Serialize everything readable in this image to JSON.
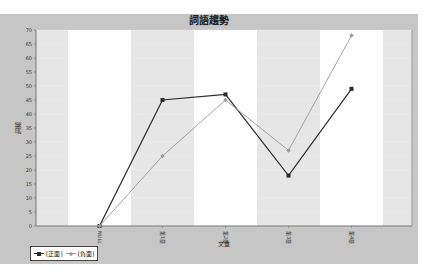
{
  "chart": {
    "title": "詞語趨勢",
    "xlabel": "文章",
    "ylabel": "詞頻"
  },
  "legend": {
    "items": [
      {
        "label": "[正面]",
        "color": "#2a2a2a"
      },
      {
        "label": "[負面]",
        "color": "#9a9a9a"
      }
    ]
  },
  "colors": {
    "panel_bg": "#c6c6c6",
    "band_gray": "#e6e6e6",
    "band_white": "#ffffff",
    "positive": "#2a2a2a",
    "negative": "#9a9a9a"
  },
  "chart_data": {
    "type": "line",
    "title": "詞語趨勢",
    "xlabel": "文章",
    "ylabel": "詞頻",
    "categories": [
      "NULL",
      "第1章",
      "第2章",
      "第3章",
      "第4章"
    ],
    "series": [
      {
        "name": "[正面]",
        "values": [
          0,
          45,
          47,
          18,
          49
        ]
      },
      {
        "name": "[負面]",
        "values": [
          0,
          25,
          45,
          27,
          68
        ]
      }
    ],
    "ylim": [
      0,
      70
    ],
    "yticks": [
      0,
      5,
      10,
      15,
      20,
      25,
      30,
      35,
      40,
      45,
      50,
      55,
      60,
      65,
      70
    ],
    "grid": true,
    "legend_position": "bottom-left"
  }
}
